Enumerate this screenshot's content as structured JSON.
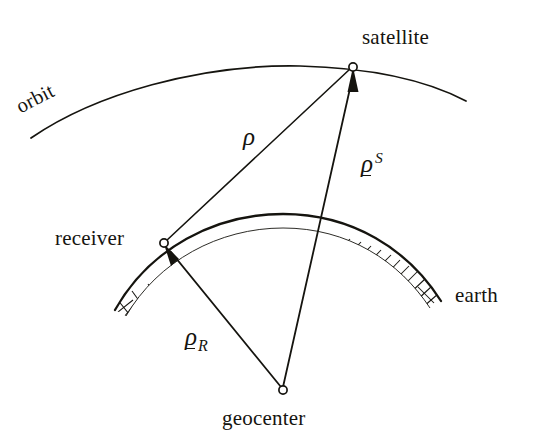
{
  "figure": {
    "type": "geometry-diagram",
    "background_color": "#ffffff",
    "ink_color": "#15140f"
  },
  "labels": {
    "orbit": "orbit",
    "satellite": "satellite",
    "receiver": "receiver",
    "earth": "earth",
    "geocenter": "geocenter"
  },
  "math_labels": {
    "rho_plain": "ρ",
    "rho_vector": "ρ",
    "superscript_s": "S",
    "subscript_r": "R"
  },
  "nodes": [
    {
      "name": "satellite",
      "x": 353,
      "y": 67,
      "marker": "open-circle"
    },
    {
      "name": "receiver",
      "x": 164,
      "y": 243,
      "marker": "open-circle"
    },
    {
      "name": "geocenter",
      "x": 283,
      "y": 390,
      "marker": "open-circle"
    }
  ],
  "vectors": [
    {
      "name": "rho",
      "from": "receiver",
      "to": "satellite",
      "arrow": false,
      "label": "ρ"
    },
    {
      "name": "rho-s",
      "from": "geocenter",
      "to": "satellite",
      "arrow": true,
      "label": "ρ S"
    },
    {
      "name": "rho-r",
      "from": "geocenter",
      "to": "receiver",
      "arrow": true,
      "label": "ρ R"
    }
  ],
  "curves": [
    {
      "name": "orbit",
      "style": "thin-arc",
      "hatched": false
    },
    {
      "name": "earth-surface",
      "style": "hatched-arc",
      "hatched": true
    }
  ]
}
